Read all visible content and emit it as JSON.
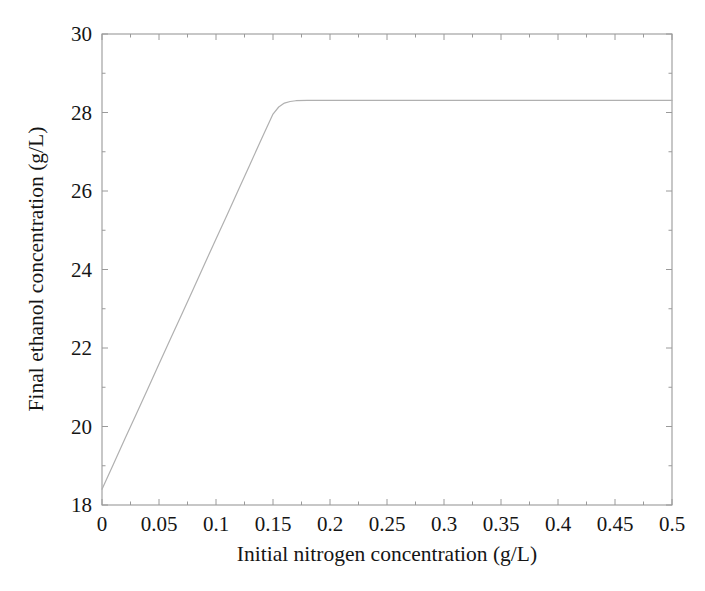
{
  "chart_data": {
    "type": "line",
    "title": "",
    "subtitle": "",
    "xlabel": "Initial nitrogen concentration (g/L)",
    "ylabel": "Final ethanol concentration (g/L)",
    "xlim": [
      0,
      0.5
    ],
    "ylim": [
      18,
      30
    ],
    "xticks": [
      0,
      0.05,
      0.1,
      0.15,
      0.2,
      0.25,
      0.3,
      0.35,
      0.4,
      0.45,
      0.5
    ],
    "xticklabels": [
      "0",
      "0.05",
      "0.1",
      "0.15",
      "0.2",
      "0.25",
      "0.3",
      "0.35",
      "0.4",
      "0.45",
      "0.5"
    ],
    "yticks": [
      18,
      20,
      22,
      24,
      26,
      28,
      30
    ],
    "yticklabels": [
      "18",
      "20",
      "22",
      "24",
      "26",
      "28",
      "30"
    ],
    "grid": false,
    "legend": null,
    "legend_position": "none",
    "box_frame": true,
    "tick_direction": "in",
    "line_color": "#b0b0b0",
    "axes_color": "#9a9a9a",
    "background_color": "#ffffff",
    "series": [
      {
        "name": "Final ethanol concentration",
        "color": "#b0b0b0",
        "linewidth": 1.2,
        "x": [
          0,
          0.01,
          0.02,
          0.03,
          0.04,
          0.05,
          0.06,
          0.07,
          0.08,
          0.09,
          0.1,
          0.11,
          0.12,
          0.13,
          0.14,
          0.15,
          0.155,
          0.16,
          0.165,
          0.17,
          0.18,
          0.19,
          0.2,
          0.22,
          0.25,
          0.275,
          0.3,
          0.325,
          0.35,
          0.375,
          0.4,
          0.425,
          0.45,
          0.475,
          0.5
        ],
        "y": [
          18.4,
          19.04,
          19.68,
          20.31,
          20.95,
          21.59,
          22.23,
          22.86,
          23.5,
          24.14,
          24.78,
          25.41,
          26.05,
          26.69,
          27.33,
          27.96,
          28.14,
          28.24,
          28.28,
          28.3,
          28.31,
          28.31,
          28.31,
          28.31,
          28.31,
          28.31,
          28.31,
          28.31,
          28.31,
          28.31,
          28.31,
          28.31,
          28.31,
          28.31,
          28.31
        ]
      }
    ],
    "annotations": [
      {
        "text": "linear rise from 18.4 g/L at 0 g/L nitrogen",
        "x": 0.0,
        "y": 18.4
      },
      {
        "text": "saturation knee",
        "x": 0.155,
        "y": 28.2
      },
      {
        "text": "plateau at 28.3 g/L",
        "x": 0.5,
        "y": 28.3
      }
    ]
  }
}
